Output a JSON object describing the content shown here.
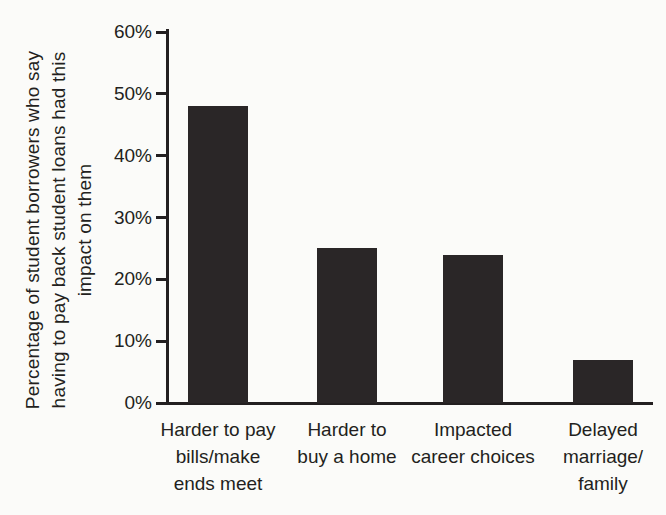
{
  "chart_data": {
    "type": "bar",
    "title": "",
    "xlabel": "",
    "ylabel": "Percentage of student borrowers who say having to pay back student loans had this impact on them",
    "ylabel_lines": [
      "Percentage of student borrowers who say",
      "having to pay back student loans had this",
      "impact on them"
    ],
    "categories": [
      "Harder to pay bills/make ends meet",
      "Harder to buy a home",
      "Impacted career choices",
      "Delayed marriage/family"
    ],
    "category_lines": [
      [
        "Harder to pay",
        "bills/make",
        "ends meet"
      ],
      [
        "Harder to",
        "buy a home"
      ],
      [
        "Impacted",
        "career choices"
      ],
      [
        "Delayed",
        "marriage/",
        "family"
      ]
    ],
    "values": [
      48,
      25,
      24,
      7
    ],
    "y_ticks": [
      0,
      10,
      20,
      30,
      40,
      50,
      60
    ],
    "y_tick_suffix": "%",
    "ylim": [
      0,
      60
    ],
    "grid": false,
    "legend": null,
    "bar_color": "#2a2627",
    "axis_color": "#231f20",
    "text_color": "#231f20",
    "background_color": "#fbfbf9"
  }
}
